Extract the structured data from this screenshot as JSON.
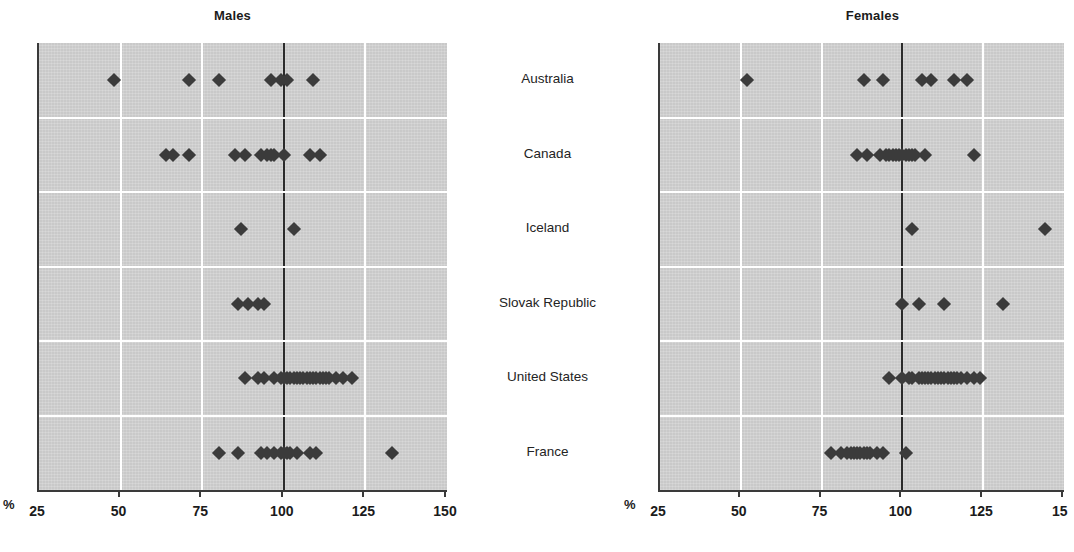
{
  "figure": {
    "unit_label": "%",
    "countries": [
      "Australia",
      "Canada",
      "Iceland",
      "Slovak Republic",
      "United States",
      "France"
    ]
  },
  "panels": [
    {
      "key": "males",
      "title": "Males"
    },
    {
      "key": "females",
      "title": "Females"
    }
  ],
  "chart_data": [
    {
      "type": "scatter",
      "title": "Males",
      "xlabel": "%",
      "ylabel": "",
      "xlim": [
        25,
        150
      ],
      "xticks": [
        25,
        50,
        75,
        100,
        125,
        150
      ],
      "xtick_labels": [
        "25",
        "50",
        "75",
        "100",
        "125",
        "150"
      ],
      "grid": true,
      "reference_line": 100,
      "legend": "none",
      "categories": [
        "Australia",
        "Canada",
        "Iceland",
        "Slovak Republic",
        "United States",
        "France"
      ],
      "series": [
        {
          "name": "Australia",
          "values": [
            48,
            71,
            80,
            96,
            99,
            101,
            109
          ]
        },
        {
          "name": "Canada",
          "values": [
            64,
            66,
            71,
            85,
            88,
            93,
            95,
            96,
            97,
            100,
            108,
            111
          ]
        },
        {
          "name": "Iceland",
          "values": [
            87,
            103
          ]
        },
        {
          "name": "Slovak Republic",
          "values": [
            86,
            89,
            92,
            94
          ]
        },
        {
          "name": "United States",
          "values": [
            88,
            92,
            94,
            97,
            99,
            100,
            101,
            102,
            103,
            104,
            105,
            106,
            107,
            108,
            109,
            110,
            111,
            112,
            113,
            114,
            116,
            118,
            121
          ]
        },
        {
          "name": "France",
          "values": [
            80,
            86,
            93,
            95,
            97,
            99,
            100,
            101,
            102,
            104,
            108,
            110,
            133
          ]
        }
      ]
    },
    {
      "type": "scatter",
      "title": "Females",
      "xlabel": "%",
      "ylabel": "",
      "xlim": [
        25,
        150
      ],
      "xticks": [
        25,
        50,
        75,
        100,
        125,
        150
      ],
      "xtick_labels": [
        "25",
        "50",
        "75",
        "100",
        "125",
        "15"
      ],
      "grid": true,
      "reference_line": 100,
      "legend": "none",
      "categories": [
        "Australia",
        "Canada",
        "Iceland",
        "Slovak Republic",
        "United States",
        "France"
      ],
      "series": [
        {
          "name": "Australia",
          "values": [
            52,
            88,
            94,
            106,
            109,
            116,
            120
          ]
        },
        {
          "name": "Canada",
          "values": [
            86,
            89,
            93,
            95,
            96,
            97,
            98,
            99,
            100,
            101,
            102,
            103,
            104,
            107,
            122
          ]
        },
        {
          "name": "Iceland",
          "values": [
            103,
            144
          ]
        },
        {
          "name": "Slovak Republic",
          "values": [
            100,
            105,
            113,
            131
          ]
        },
        {
          "name": "United States",
          "values": [
            96,
            100,
            102,
            103,
            105,
            106,
            107,
            108,
            109,
            110,
            111,
            112,
            113,
            114,
            115,
            116,
            117,
            118,
            120,
            122,
            124
          ]
        },
        {
          "name": "France",
          "values": [
            78,
            81,
            83,
            84,
            85,
            86,
            87,
            88,
            89,
            90,
            92,
            94,
            101
          ]
        }
      ]
    }
  ]
}
